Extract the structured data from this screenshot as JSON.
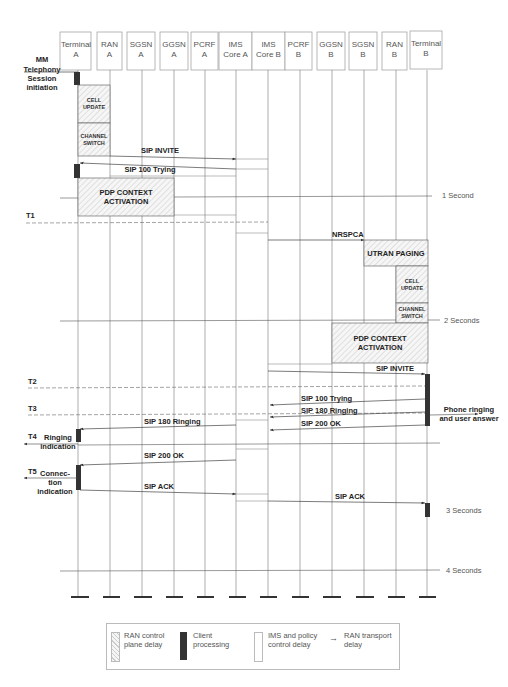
{
  "entities": [
    {
      "line1": "Terminal",
      "line2": "A"
    },
    {
      "line1": "RAN",
      "line2": "A"
    },
    {
      "line1": "SGSN",
      "line2": "A"
    },
    {
      "line1": "GGSN",
      "line2": "A"
    },
    {
      "line1": "PCRF",
      "line2": "A"
    },
    {
      "line1": "IMS",
      "line2": "Core A"
    },
    {
      "line1": "IMS",
      "line2": "Core B"
    },
    {
      "line1": "PCRF",
      "line2": "B"
    },
    {
      "line1": "GGSN",
      "line2": "B"
    },
    {
      "line1": "SGSN",
      "line2": "B"
    },
    {
      "line1": "RAN",
      "line2": "B"
    },
    {
      "line1": "Terminal",
      "line2": "B"
    }
  ],
  "start_label": [
    "MM",
    "Telephony",
    "Session",
    "initiation"
  ],
  "blocks": {
    "cell_update_a": [
      "CELL",
      "UPDATE"
    ],
    "channel_switch_a": [
      "CHANNEL",
      "SWITCH"
    ],
    "pdp_a": [
      "PDP CONTEXT",
      "ACTIVATION"
    ],
    "utran_paging": "UTRAN PAGING",
    "cell_update_b": [
      "CELL",
      "UPDATE"
    ],
    "channel_switch_b": [
      "CHANNEL",
      "SWITCH"
    ],
    "pdp_b": [
      "PDP CONTEXT",
      "ACTIVATION"
    ]
  },
  "messages": {
    "sip_invite_a": "SIP INVITE",
    "sip_100_a": "SIP 100 Trying",
    "nrspca": "NRSPCA",
    "sip_invite_b": "SIP INVITE",
    "sip_100_b": "SIP 100 Trying",
    "sip_180_b": "SIP 180 Ringing",
    "sip_200_b": "SIP 200 OK",
    "sip_180_a": "SIP 180 Ringing",
    "sip_200_a": "SIP 200 OK",
    "sip_ack_a": "SIP ACK",
    "sip_ack_b": "SIP ACK"
  },
  "markers": {
    "t1": "T1",
    "t2": "T2",
    "t3": "T3",
    "t4": "T4",
    "t5": "T5"
  },
  "side_notes": {
    "ringing": [
      "Ringing",
      "indication"
    ],
    "connection": [
      "Connec-",
      "tion",
      "indication"
    ],
    "phone_ringing": [
      "Phone ringing",
      "and user answer"
    ]
  },
  "time_scale": {
    "s1": "1 Second",
    "s2": "2 Seconds",
    "s3": "3 Seconds",
    "s4": "4 Seconds"
  },
  "legend": {
    "ran_control": [
      "RAN control",
      "plane delay"
    ],
    "client": [
      "Client",
      "processing"
    ],
    "ims_policy": [
      "IMS and policy",
      "control delay"
    ],
    "ran_transport": [
      "RAN transport",
      "delay"
    ]
  },
  "colors": {
    "line": "#555555",
    "client_bar": "#333333",
    "hatch": "#bbbbbb"
  }
}
